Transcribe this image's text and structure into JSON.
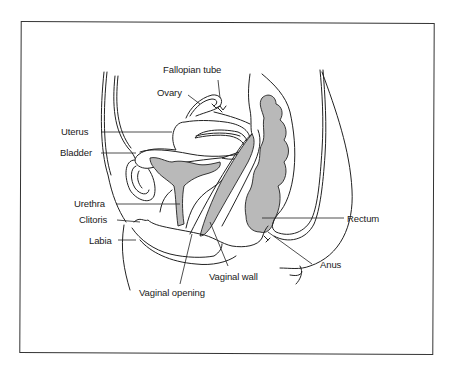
{
  "diagram": {
    "type": "anatomical-cross-section",
    "colors": {
      "outline": "#222222",
      "organ_fill_gray": "#b9b9b9",
      "background": "#ffffff",
      "frame": "#333333"
    },
    "labels": {
      "fallopian_tube": "Fallopian tube",
      "ovary": "Ovary",
      "uterus": "Uterus",
      "bladder": "Bladder",
      "urethra": "Urethra",
      "clitoris": "Clitoris",
      "labia": "Labia",
      "vaginal_opening": "Vaginal opening",
      "vaginal_wall": "Vaginal wall",
      "anus": "Anus",
      "rectum": "Rectum"
    }
  }
}
